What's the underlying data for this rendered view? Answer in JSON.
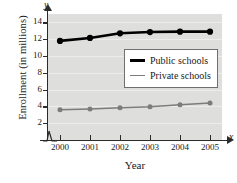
{
  "chart_data": {
    "type": "line",
    "title": "",
    "xlabel": "Year",
    "ylabel": "Enrollment (in millions)",
    "x": [
      2000,
      2001,
      2002,
      2003,
      2004,
      2005
    ],
    "categories": [
      "2000",
      "2001",
      "2002",
      "2003",
      "2004",
      "2005"
    ],
    "xlim": [
      1999.6,
      2005.4
    ],
    "ylim": [
      0,
      15
    ],
    "yticks": [
      2,
      4,
      6,
      8,
      10,
      12,
      14
    ],
    "ytick_labels": [
      "2",
      "4",
      "6",
      "8",
      "10",
      "12",
      "14"
    ],
    "grid": true,
    "grid_axis": "y",
    "axis_break": true,
    "legend_position": "center-right",
    "axis_letters": {
      "x": "x",
      "y": "y"
    },
    "series": [
      {
        "name": "Public schools",
        "color": "#000000",
        "marker": "filled-circle",
        "line_width": 2.6,
        "values": [
          11.8,
          12.15,
          12.7,
          12.85,
          12.9,
          12.9
        ]
      },
      {
        "name": "Private schools",
        "color": "#7c7c7c",
        "marker": "filled-circle",
        "line_width": 1.5,
        "values": [
          3.6,
          3.7,
          3.85,
          3.95,
          4.2,
          4.4
        ]
      }
    ]
  },
  "legend": {
    "items": [
      {
        "label": "Public schools"
      },
      {
        "label": "Private schools"
      }
    ]
  }
}
